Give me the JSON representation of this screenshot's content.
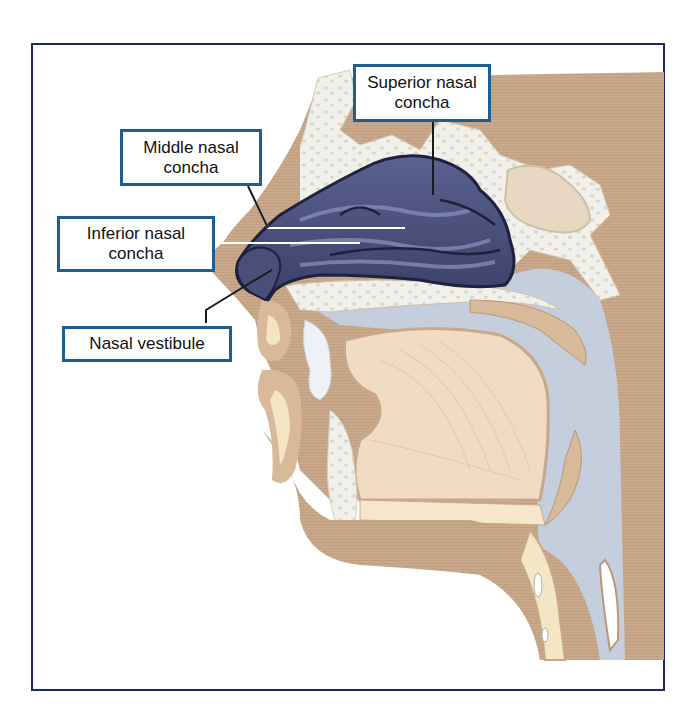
{
  "figure": {
    "colors": {
      "frame_border": "#1c2563",
      "label_border": "#1f5f8f",
      "soft_tissue": "#c9a98a",
      "bone": "#efeee6",
      "airway": "#c5cedc",
      "conchae": "#4a4f78",
      "tongue": "#f0dcc2",
      "cartilage": "#f3e6c4"
    }
  },
  "labels": [
    {
      "id": "superior-nasal-concha",
      "line1": "Superior nasal",
      "line2": "concha"
    },
    {
      "id": "middle-nasal-concha",
      "line1": "Middle nasal",
      "line2": "concha"
    },
    {
      "id": "inferior-nasal-concha",
      "line1": "Inferior nasal",
      "line2": "concha"
    },
    {
      "id": "nasal-vestibule",
      "line1": "Nasal vestibule"
    }
  ]
}
